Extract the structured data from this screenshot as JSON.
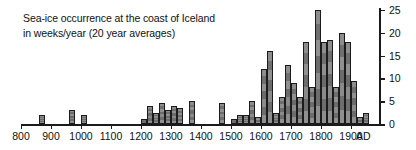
{
  "chart_data": {
    "type": "bar",
    "title": "Sea-ice occurrence at the coast of Iceland in weeks/year (20 year averages)",
    "title_lines": [
      "Sea-ice occurrence at the coast of Iceland",
      "in weeks/year (20 year averages)"
    ],
    "xlabel": "AD",
    "ylabel": "",
    "xlim": [
      790,
      1970
    ],
    "ylim": [
      0,
      25
    ],
    "y_ticks": [
      0,
      5,
      10,
      15,
      20,
      25
    ],
    "x_ticks": [
      800,
      900,
      1000,
      1100,
      1200,
      1300,
      1400,
      1500,
      1600,
      1700,
      1800,
      1900
    ],
    "x_tick_labels": [
      "800",
      "900",
      "1000",
      "1100",
      "1200",
      "1300",
      "1400",
      "1500",
      "1600",
      "1700",
      "1800",
      "1900"
    ],
    "axis_unit_label": "AD",
    "bin_width_years": 20,
    "grid": false,
    "legend": null,
    "bar_color": "#808080",
    "bar_edge_color": "#1b1b1b",
    "categories": [
      860,
      960,
      1000,
      1200,
      1220,
      1240,
      1260,
      1280,
      1300,
      1320,
      1360,
      1460,
      1500,
      1520,
      1540,
      1560,
      1580,
      1600,
      1620,
      1640,
      1660,
      1680,
      1700,
      1720,
      1740,
      1760,
      1780,
      1800,
      1820,
      1840,
      1860,
      1880,
      1900,
      1920,
      1940
    ],
    "values": [
      2,
      3,
      2,
      1,
      4,
      2.5,
      4.5,
      3,
      4,
      3.5,
      5,
      4.5,
      1,
      2,
      2,
      5,
      1.5,
      12,
      16,
      2.5,
      6,
      13,
      9,
      6,
      18,
      8,
      25,
      18,
      18.5,
      8,
      20,
      18,
      9.5,
      1.5,
      2.5
    ]
  },
  "axis": {
    "unit": "AD"
  }
}
